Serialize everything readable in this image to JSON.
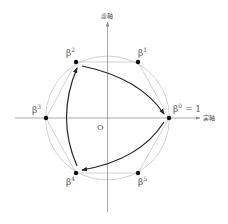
{
  "axes": {
    "real_label": "実軸",
    "imag_label": "虚軸",
    "origin_label": "O"
  },
  "points": [
    {
      "name": "beta0",
      "base": "β",
      "sup": "0",
      "suffix": " = 1"
    },
    {
      "name": "beta1",
      "base": "β",
      "sup": "1",
      "suffix": ""
    },
    {
      "name": "beta2",
      "base": "β",
      "sup": "2",
      "suffix": ""
    },
    {
      "name": "beta3",
      "base": "β",
      "sup": "3",
      "suffix": ""
    },
    {
      "name": "beta4",
      "base": "β",
      "sup": "4",
      "suffix": ""
    },
    {
      "name": "beta5",
      "base": "β",
      "sup": "5",
      "suffix": ""
    }
  ],
  "arrows": [
    {
      "from": "β²",
      "to": "β⁰"
    },
    {
      "from": "β⁰",
      "to": "β⁴"
    },
    {
      "from": "β⁴",
      "to": "β²"
    }
  ],
  "colors": {
    "circle": "#c8c8c8",
    "hexagon": "#c8c8c8",
    "axis": "#888888",
    "arrow": "#222222",
    "point": "#111111"
  }
}
